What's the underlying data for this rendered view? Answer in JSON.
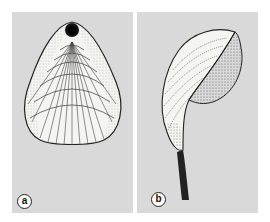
{
  "figure": {
    "panels": [
      {
        "id": "a",
        "label": "a",
        "subject": "brachiopod shell, dorsal view with pedicle foramen"
      },
      {
        "id": "b",
        "label": "b",
        "subject": "brachiopod shell, lateral view with pedicle stalk"
      }
    ],
    "colors": {
      "panel_background": "#d9d9d9",
      "page_background": "#ffffff",
      "ink": "#222222"
    }
  }
}
